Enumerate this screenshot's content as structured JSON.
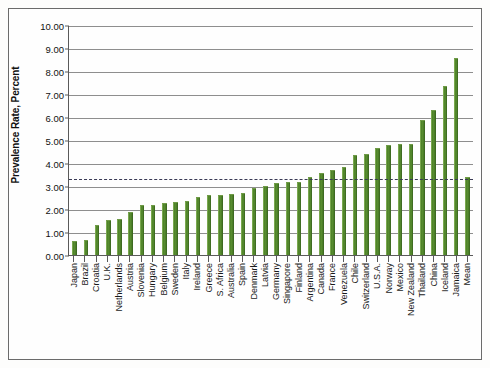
{
  "chart_data": {
    "type": "bar",
    "title": "",
    "xlabel": "",
    "ylabel": "Prevalence Rate, Percent",
    "ylim": [
      0,
      10
    ],
    "ytick_labels": [
      "10.00",
      "9.00",
      "8.00",
      "7.00",
      "6.00",
      "5.00",
      "4.00",
      "3.00",
      "2.00",
      "1.00",
      "0.00"
    ],
    "ytick_values": [
      10,
      9,
      8,
      7,
      6,
      5,
      4,
      3,
      2,
      1,
      0
    ],
    "grid": true,
    "legend": "none",
    "reference_line": {
      "label": "Mean",
      "value": 3.33,
      "style": "dotted"
    },
    "categories": [
      "Japan",
      "Brazil",
      "Croatia",
      "U.K.",
      "Netherlands",
      "Austria",
      "Slovenia",
      "Hungary",
      "Belgium",
      "Sweden",
      "Italy",
      "Ireland",
      "Greece",
      "S. Africa",
      "Australia",
      "Spain",
      "Denmark",
      "Latvia",
      "Germany",
      "Singapore",
      "Finland",
      "Argentina",
      "Canada",
      "France",
      "Venezuela",
      "Chile",
      "Switzerland",
      "U.S.A.",
      "Norway",
      "Mexico",
      "New Zealand",
      "Thailand",
      "China",
      "Iceland",
      "Jamaica",
      "Mean"
    ],
    "values": [
      0.56,
      0.6,
      1.24,
      1.48,
      1.52,
      1.81,
      2.12,
      2.13,
      2.23,
      2.28,
      2.29,
      2.47,
      2.55,
      2.56,
      2.62,
      2.67,
      2.88,
      2.95,
      3.07,
      3.13,
      3.12,
      3.36,
      3.52,
      3.65,
      3.79,
      4.3,
      4.36,
      4.63,
      4.75,
      4.79,
      4.79,
      5.83,
      6.26,
      7.29,
      8.52,
      3.36
    ],
    "colors": {
      "bar_fill": "#588e2f",
      "bar_edge": "#3f6c22",
      "gridline": "#8e8e8e",
      "axis": "#5a5a5a",
      "reference_line": "#3a3a55",
      "background": "#fefefe"
    }
  }
}
